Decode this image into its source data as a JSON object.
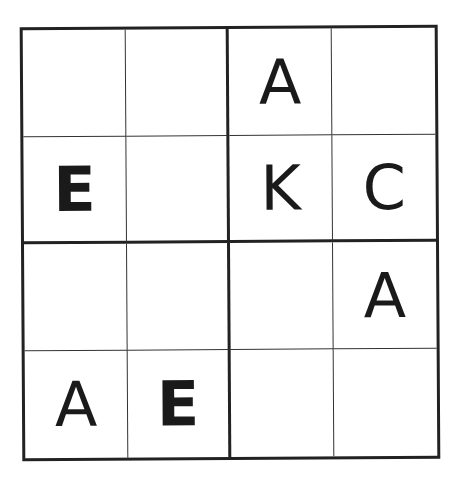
{
  "puzzle": {
    "type": "4x4 letter sudoku",
    "size": 4,
    "box_size": 2,
    "rows": [
      [
        "",
        "",
        "A",
        ""
      ],
      [
        "E",
        "",
        "K",
        "C"
      ],
      [
        "",
        "",
        "",
        "A"
      ],
      [
        "A",
        "E",
        "",
        ""
      ]
    ]
  }
}
